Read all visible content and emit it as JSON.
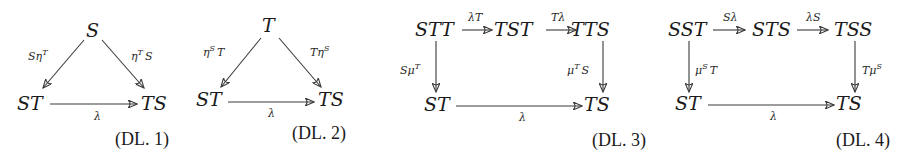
{
  "diagrams": [
    {
      "tag": "(DL. 1)",
      "nodes": {
        "top": "S",
        "left": "ST",
        "right": "TS"
      },
      "arrows": {
        "left": {
          "base": "Sη",
          "sup": "T",
          "post": ""
        },
        "right": {
          "base": "η",
          "sup": "T",
          "post": "S"
        },
        "bottom": "λ"
      }
    },
    {
      "tag": "(DL. 2)",
      "nodes": {
        "top": "T",
        "left": "ST",
        "right": "TS"
      },
      "arrows": {
        "left": {
          "base": "η",
          "sup": "S",
          "post": "T"
        },
        "right": {
          "base": "Tη",
          "sup": "S",
          "post": ""
        },
        "bottom": "λ"
      }
    },
    {
      "tag": "(DL. 3)",
      "nodes": {
        "tl": "STT",
        "tm": "TST",
        "tr": "TTS",
        "bl": "ST",
        "br": "TS"
      },
      "arrows": {
        "top1": "λT",
        "top2": "Tλ",
        "left": {
          "base": "Sμ",
          "sup": "T",
          "post": ""
        },
        "right": {
          "base": "μ",
          "sup": "T",
          "post": "S"
        },
        "bottom": "λ"
      }
    },
    {
      "tag": "(DL. 4)",
      "nodes": {
        "tl": "SST",
        "tm": "STS",
        "tr": "TSS",
        "bl": "ST",
        "br": "TS"
      },
      "arrows": {
        "top1": "Sλ",
        "top2": "λS",
        "left": {
          "base": "μ",
          "sup": "S",
          "post": "T"
        },
        "right": {
          "base": "Tμ",
          "sup": "S",
          "post": ""
        },
        "bottom": "λ"
      }
    }
  ],
  "colors": {
    "ink": "#1a1a1a",
    "arrow": "#3a3a3a",
    "background": "#ffffff"
  }
}
